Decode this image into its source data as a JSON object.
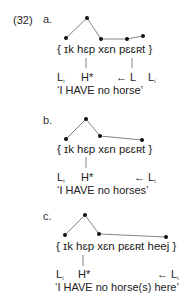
{
  "example_number": "(32)",
  "panels": [
    {
      "label": "a.",
      "segments": "{ ɪk hɛp xɛn pɛɛʀt }",
      "tones": {
        "left": "L",
        "left_sub": "i",
        "accent": "H*",
        "mid": "← L",
        "right": "L",
        "right_sub": "i"
      },
      "gloss": "‘I HAVE no horse’",
      "contour_points": [
        [
          66,
          38
        ],
        [
          87,
          18
        ],
        [
          101,
          39
        ],
        [
          127,
          39
        ],
        [
          143,
          36
        ]
      ]
    },
    {
      "label": "b.",
      "segments": "{ ɪk hɛp xɛn pɛɛʀt }",
      "tones": {
        "left": "L",
        "left_sub": "i",
        "accent": "H*",
        "right": "← L",
        "right_sub": "i"
      },
      "gloss": "‘I HAVE no horses’",
      "contour_points": [
        [
          66,
          139
        ],
        [
          86,
          119
        ],
        [
          100,
          136
        ],
        [
          142,
          140
        ]
      ]
    },
    {
      "label": "c.",
      "segments": "{ ɪk hɛp xɛn pɛɛʀt heej }",
      "tones": {
        "left": "L",
        "left_sub": "i",
        "accent": "H*",
        "right": "← L",
        "right_sub": "i"
      },
      "gloss": "‘I HAVE no horse(s) here’",
      "contour_points": [
        [
          65,
          235
        ],
        [
          85,
          215
        ],
        [
          99,
          234
        ],
        [
          166,
          237
        ]
      ]
    }
  ]
}
